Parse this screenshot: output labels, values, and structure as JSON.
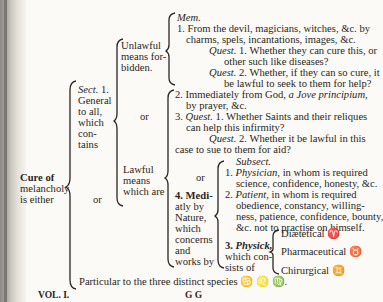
{
  "page": {
    "root_label": [
      "Cure of",
      "melancholy",
      "is either"
    ],
    "general": {
      "label_sect": "Sect.",
      "label_num": " 1.",
      "label_rest": [
        "General",
        "to all,",
        "which",
        "con-",
        "tains"
      ]
    },
    "or_1": "or",
    "unlawful": {
      "label": [
        "Unlawful",
        "means for-",
        "bidden."
      ],
      "mem": "Mem.",
      "item1": [
        "1. From the devil, magicians, witches, &c. by",
        "charms, spels, incantations, images, &c."
      ],
      "quest1_label": "Quest.",
      "quest1": [
        " 1. Whether they can cure this, or",
        "other such like diseases?"
      ],
      "quest2_label": "Quest.",
      "quest2": [
        " 2. Whether, if they can so cure, it",
        "be lawful to seek to them for help?"
      ]
    },
    "or_2": "or",
    "lawful": {
      "label": [
        "Lawful",
        "means",
        "which are"
      ],
      "item2_prefix": "2. Immediately from God, ",
      "item2_italic": "a Jove principium,",
      "item2_cont": "by prayer, &c.",
      "item3_prefix": "3. ",
      "item3_quest": "Quest.",
      "item3_text": " 1. Whether Saints and their reliques",
      "item3_cont": "can help this infirmity?",
      "item3_q2_label": "Quest.",
      "item3_q2": " 2. Whether it be lawful in this",
      "item3_q2_cont": "case to sue to them for aid?",
      "or_3": "or",
      "item4_label": [
        "4. Medi-",
        "atly by",
        "Nature,",
        "which",
        "concerns",
        "and",
        "works by"
      ],
      "subsect": "Subsect.",
      "physician_num": "1. ",
      "physician": "Physician,",
      "physician_text": " in whom is required",
      "physician_cont": "science, confidence, honesty, &c.",
      "patient_num": "2. ",
      "patient": "Patient,",
      "patient_text": " in whom is required",
      "patient_cont": [
        "obedience, constancy, willing-",
        "ness, patience, confidence, bounty,",
        "&c. not to practise on himself."
      ],
      "physick_num": "3. ",
      "physick": "Physick,",
      "physick_cont": [
        "which con-",
        "sists of"
      ],
      "physick_items": [
        "Diætetical ♈",
        "Pharmaceutical ♉",
        "Chirurgical ♊"
      ]
    },
    "particular": "Particular to the three distinct species ♋ ♌ ♍.",
    "footer": {
      "volume": "VOL. I.",
      "signature": "G G"
    }
  }
}
